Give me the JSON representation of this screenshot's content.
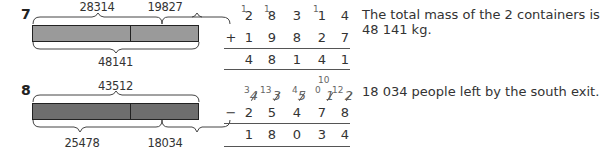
{
  "problems": [
    {
      "number": "7",
      "bar_model": {
        "top_labels": [
          "28314",
          "19827"
        ],
        "bottom_labels": [
          "48141"
        ],
        "bar_color": "#9a9a9a"
      },
      "column_calc": {
        "operator": "+",
        "top_row": [
          "2",
          "8",
          "3",
          "1",
          "4"
        ],
        "carries": [
          "1",
          "1",
          "",
          "1",
          ""
        ],
        "second_row": [
          "1",
          "9",
          "8",
          "2",
          "7"
        ],
        "result_row": [
          "4",
          "8",
          "1",
          "4",
          "1"
        ]
      },
      "answer": "The total mass of the 2 containers is 48 141 kg."
    },
    {
      "number": "8",
      "bar_model": {
        "top_labels": [
          "43512"
        ],
        "bottom_labels": [
          "25478",
          "18034"
        ],
        "bar_color": "#6e6e6e"
      },
      "column_calc": {
        "operator": "−",
        "top_row": [
          "4",
          "3",
          "5",
          "1",
          "2"
        ],
        "exchanges": [
          "3",
          "13",
          "4",
          "0",
          "12"
        ],
        "extra_exchange": "10",
        "second_row": [
          "2",
          "5",
          "4",
          "7",
          "8"
        ],
        "result_row": [
          "1",
          "8",
          "0",
          "3",
          "4"
        ]
      },
      "answer": "18 034 people left by the south exit."
    }
  ]
}
